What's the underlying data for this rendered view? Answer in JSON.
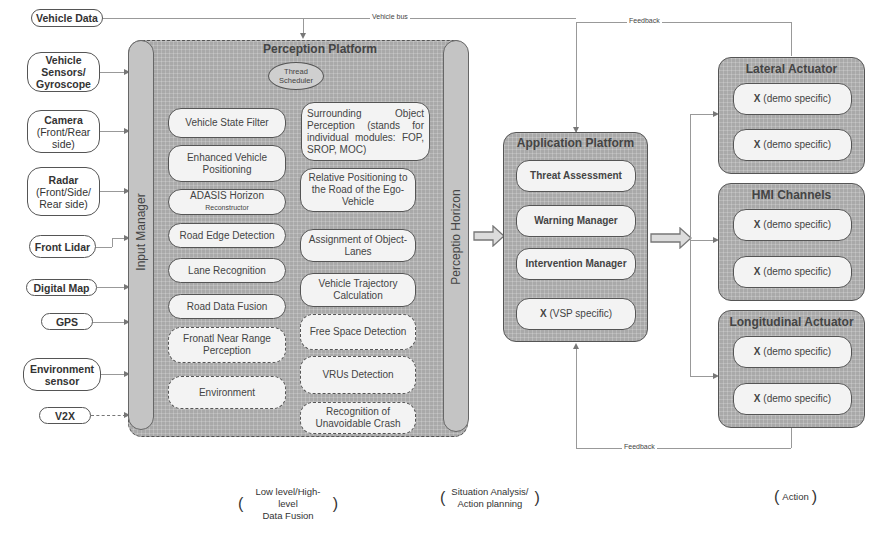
{
  "inputs": [
    {
      "label": "Vehicle Data",
      "sub": ""
    },
    {
      "label": "Vehicle Sensors/ Gyroscope",
      "sub": ""
    },
    {
      "label": "Camera",
      "sub": "(Front/Rear side)"
    },
    {
      "label": "Radar",
      "sub": "(Front/Side/ Rear side)"
    },
    {
      "label": "Front Lidar",
      "sub": ""
    },
    {
      "label": "Digital Map",
      "sub": ""
    },
    {
      "label": "GPS",
      "sub": ""
    },
    {
      "label": "Environment sensor",
      "sub": ""
    },
    {
      "label": "V2X",
      "sub": ""
    }
  ],
  "connections": {
    "vehicle_bus": "Vehicle bus",
    "feedback_top": "Feedback",
    "feedback_bottom": "Feedback"
  },
  "perception_platform": {
    "title": "Perception Platform",
    "thread_scheduler": "Thread Scheduler",
    "input_manager": "Input Manager",
    "perceptio_horizon": "Perceptio Horizon",
    "left_modules": [
      {
        "label": "Vehicle State Filter",
        "style": "solid"
      },
      {
        "label": "Enhanced Vehicle Positioning",
        "style": "solid"
      },
      {
        "label": "ADASIS Horizon",
        "sub": "Reconstructor",
        "style": "solid"
      },
      {
        "label": "Road Edge Detection",
        "style": "solid"
      },
      {
        "label": "Lane Recognition",
        "style": "solid"
      },
      {
        "label": "Road Data Fusion",
        "style": "solid"
      },
      {
        "label": "Fronatl Near Range Perception",
        "style": "dashed"
      },
      {
        "label": "Environment",
        "style": "dashed"
      }
    ],
    "right_modules": [
      {
        "label": "Surrounding Object Perception (stands for individual modules: FOP, SROP, MOC)",
        "style": "solid"
      },
      {
        "label": "Relative Positioning to the Road of the Ego-Vehicle",
        "style": "solid"
      },
      {
        "label": "Assignment of Object-Lanes",
        "style": "solid"
      },
      {
        "label": "Vehicle Trajectory Calculation",
        "style": "solid"
      },
      {
        "label": "Free Space Detection",
        "style": "dashed"
      },
      {
        "label": "VRUs Detection",
        "style": "dashed"
      },
      {
        "label": "Recognition of Unavoidable Crash",
        "style": "dashed"
      }
    ]
  },
  "application_platform": {
    "title": "Application Platform",
    "modules": [
      {
        "label": "Threat Assessment",
        "bold": true
      },
      {
        "label": "Warning Manager",
        "bold": true
      },
      {
        "label": "Intervention Manager",
        "bold": true
      },
      {
        "x": "X",
        "label": "(VSP specific)",
        "bold": false
      }
    ]
  },
  "actuators": [
    {
      "title": "Lateral Actuator",
      "items": [
        {
          "x": "X",
          "label": "(demo specific)"
        },
        {
          "x": "X",
          "label": "(demo specific)"
        }
      ]
    },
    {
      "title": "HMI Channels",
      "items": [
        {
          "x": "X",
          "label": "(demo specific)"
        },
        {
          "x": "X",
          "label": "(demo specific)"
        }
      ]
    },
    {
      "title": "Longitudinal Actuator",
      "items": [
        {
          "x": "X",
          "label": "(demo specific)"
        },
        {
          "x": "X",
          "label": "(demo specific)"
        }
      ]
    }
  ],
  "phases": [
    {
      "line1": "Low level/High-level",
      "line2": "Data Fusion"
    },
    {
      "line1": "Situation Analysis/",
      "line2": "Action planning"
    },
    {
      "line1": "Action",
      "line2": ""
    }
  ],
  "parens": {
    "open": "(",
    "close": ")"
  }
}
